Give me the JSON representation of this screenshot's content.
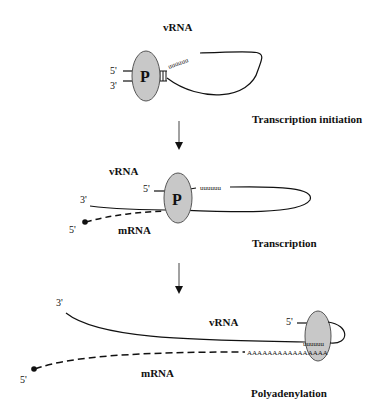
{
  "diagram": {
    "colors": {
      "stroke": "#111111",
      "polymerase_fill": "#c8c8c8",
      "polymerase_stroke": "#555555",
      "arrow": "#444444"
    },
    "stages": [
      {
        "name": "Transcription initiation",
        "vrna_label": "vRNA",
        "polymerase_label": "P",
        "end_5": "5'",
        "end_3": "3'",
        "sequence": "uuuuuu"
      },
      {
        "name": "Transcription",
        "vrna_label": "vRNA",
        "mrna_label": "mRNA",
        "polymerase_label": "P",
        "vrna_end_5": "5'",
        "vrna_end_3": "3'",
        "mrna_end_5": "5'",
        "sequence": "uuuuuu"
      },
      {
        "name": "Polyadenylation",
        "vrna_label": "vRNA",
        "mrna_label": "mRNA",
        "vrna_end_5": "5'",
        "vrna_end_3": "3'",
        "mrna_end_5": "5'",
        "sequence_u": "uuuuuu",
        "poly_a": "AAAAAAAAAAAAAAAA"
      }
    ]
  }
}
